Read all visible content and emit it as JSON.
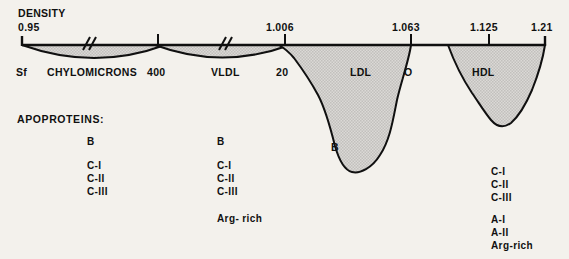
{
  "figure": {
    "title_axis": "DENSITY",
    "background_color": "#f3f1ec",
    "ink_color": "#101010",
    "fill_color": "#d8d6d3"
  },
  "density_axis": {
    "label": "DENSITY",
    "ticks": [
      {
        "value": "0.95",
        "x": 22
      },
      {
        "value": "1.006",
        "x": 285
      },
      {
        "value": "1.063",
        "x": 411
      },
      {
        "value": "1.125",
        "x": 489
      },
      {
        "value": "1.21",
        "x": 545
      }
    ]
  },
  "sf_axis": {
    "label": "Sf",
    "ticks": [
      {
        "value": "400",
        "x": 158
      },
      {
        "value": "20",
        "x": 285
      },
      {
        "value": "O",
        "x": 411
      }
    ]
  },
  "classes": [
    {
      "name": "CHYLOMICRONS",
      "x": 48,
      "shape": "lens",
      "apo_column": 1
    },
    {
      "name": "VLDL",
      "x": 212,
      "shape": "lens",
      "apo_column": 2
    },
    {
      "name": "LDL",
      "x": 352,
      "shape": "peak",
      "apo_column": 3
    },
    {
      "name": "HDL",
      "x": 478,
      "shape": "peak",
      "apo_column": 4
    }
  ],
  "curve_labels": [
    {
      "text": "B",
      "x": 333,
      "y": 148,
      "for": "LDL"
    }
  ],
  "apoproteins": {
    "heading": "APOPROTEINS:",
    "columns": [
      {
        "for": "CHYLOMICRONS",
        "x": 88,
        "groups": [
          {
            "items": [
              "B"
            ]
          },
          {
            "items": [
              "C-I",
              "C-II",
              "C-III"
            ]
          }
        ]
      },
      {
        "for": "VLDL",
        "x": 218,
        "groups": [
          {
            "items": [
              "B"
            ]
          },
          {
            "items": [
              "C-I",
              "C-II",
              "C-III"
            ]
          },
          {
            "items": [
              "Arg- rich"
            ]
          }
        ]
      },
      {
        "for": "HDL",
        "x": 492,
        "groups": [
          {
            "items": [
              "C-I",
              "C-II",
              "C-III"
            ]
          },
          {
            "items": [
              "A-I",
              "A-II",
              "Arg-rich"
            ]
          }
        ]
      }
    ]
  }
}
